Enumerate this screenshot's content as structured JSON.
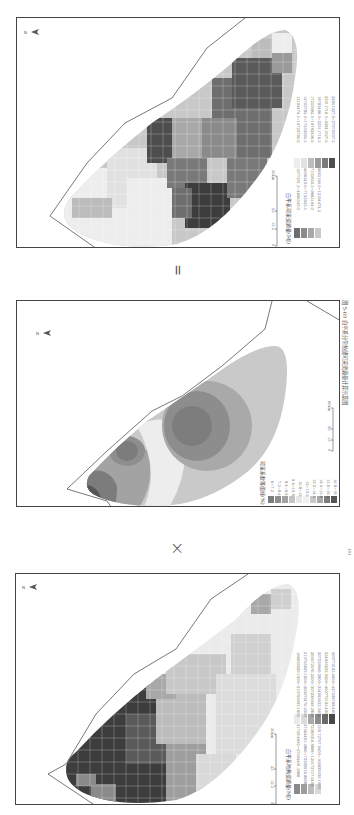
{
  "figure": {
    "caption": "图 5-69  白平系分带热储可采资源量计算示意图",
    "page_number": "191",
    "operators": {
      "times": "×",
      "equals": "="
    }
  },
  "panels": {
    "top": {
      "name": "recoverable-resource-map",
      "north_label": "N",
      "legend_title": "白平系可采资源量(MJ)",
      "legend_items": [
        {
          "label": "1077231.5~4606543.0",
          "color": "#6e6e6e"
        },
        {
          "label": "4606543.0~7135853.5",
          "color": "#8a8a8a"
        },
        {
          "label": "7135853.5~9665164.0",
          "color": "#a8a8a8"
        },
        {
          "label": "9665164.0~12194474.5",
          "color": "#c8c8c8"
        },
        {
          "label": "12194474.5~14723785.0",
          "color": "#e2e2e2"
        },
        {
          "label": "14723785.0~17253095.5",
          "color": "#ededed"
        },
        {
          "label": "17253095.5~19782406.0",
          "color": "#bdbdbd"
        },
        {
          "label": "19782406.0~22311716.5",
          "color": "#9a9a9a"
        },
        {
          "label": "22311716.5~24841027.0",
          "color": "#7a7a7a"
        },
        {
          "label": "24841027.0~27370337.5",
          "color": "#4e4e4e"
        }
      ],
      "scale_bar": {
        "ticks": [
          "0",
          "12.5",
          "25",
          "50km"
        ]
      }
    },
    "middle": {
      "name": "recovery-factor-map",
      "north_label": "N",
      "legend_title": "可采系数等值线(%)",
      "legend_items": [
        {
          "label": "6~7.2",
          "color": "#7c7c7c"
        },
        {
          "label": "7.2~8.4",
          "color": "#8e8e8e"
        },
        {
          "label": "8.4~9.6",
          "color": "#a3a3a3"
        },
        {
          "label": "9.6~10.8",
          "color": "#c4c4c4"
        },
        {
          "label": "10.8~12",
          "color": "#e6e6e6"
        },
        {
          "label": "12~13.2",
          "color": "#f0f0f0"
        },
        {
          "label": "13.2~14.4",
          "color": "#c9c9c9"
        },
        {
          "label": "14.4~15.6",
          "color": "#a9a9a9"
        },
        {
          "label": "15.6~16.8",
          "color": "#7d7d7d"
        },
        {
          "label": "16.8~18",
          "color": "#555555"
        }
      ],
      "scale_bar": {
        "ticks": [
          "0",
          "15",
          "30",
          "60km"
        ]
      }
    },
    "bottom": {
      "name": "resource-map",
      "north_label": "N",
      "legend_title": "白平系地热资源量(MJ)",
      "legend_items": [
        {
          "label": "41758.4692~47564491.2866",
          "color": "#8a8a8a"
        },
        {
          "label": "47564491.2866~72383016.8898",
          "color": "#9e9e9e"
        },
        {
          "label": "72383016.8898~120172757.0400",
          "color": "#bdbdbd"
        },
        {
          "label": "120172757.0400~166939330.1000",
          "color": "#d9d9d9"
        },
        {
          "label": "166939330.1000~213705903.1600",
          "color": "#ebebeb"
        },
        {
          "label": "213705903.1600~260472476.2200",
          "color": "#dcdcdc"
        },
        {
          "label": "260472476.2200~307239049.2800",
          "color": "#a8a8a8"
        },
        {
          "label": "307239049.2800~354005622.3400",
          "color": "#8c8c8c"
        },
        {
          "label": "354005622.3400~400772195.4000",
          "color": "#6a6a6a"
        },
        {
          "label": "400772195.4000~447538768.4600",
          "color": "#484848"
        }
      ],
      "scale_bar": {
        "ticks": [
          "0",
          "12.5",
          "25",
          "50km"
        ]
      }
    }
  },
  "colors": {
    "frame": "#444444",
    "boundary": "#555555",
    "background": "#ffffff"
  }
}
